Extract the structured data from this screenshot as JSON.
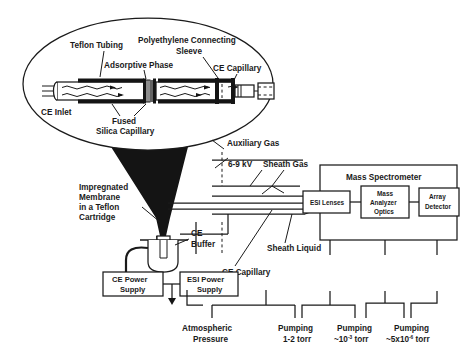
{
  "figure": {
    "inset": {
      "labels": {
        "teflon_tubing": "Teflon Tubing",
        "adsorptive_phase": "Adsorptive Phase",
        "polyethylene_sleeve_line1": "Polyethylene Connecting",
        "polyethylene_sleeve_line2": "Sleeve",
        "ce_capillary": "CE Capillary",
        "ce_inlet": "CE Inlet",
        "fused_line1": "Fused",
        "fused_line2": "Silica Capillary"
      }
    },
    "source_region": {
      "impregnated_line1": "Impregnated",
      "impregnated_line2": "Membrane",
      "impregnated_line3": "in a Teflon",
      "impregnated_line4": "Cartridge",
      "auxiliary_gas": "Auxiliary Gas",
      "voltage": "6-9 kV",
      "sheath_gas": "Sheath Gas",
      "sheath_liquid": "Sheath Liquid",
      "ce_buffer_line1": "CE",
      "ce_buffer_line2": "Buffer",
      "ce_capillary": "CE Capillary"
    },
    "power_supplies": {
      "ce_line1": "CE Power",
      "ce_line2": "Supply",
      "esi_line1": "ESI Power",
      "esi_line2": "Supply"
    },
    "mass_spectrometer": {
      "title": "Mass Spectrometer",
      "esi_lenses": "ESI Lenses",
      "analyzer_line1": "Mass",
      "analyzer_line2": "Analyzer",
      "analyzer_line3": "Optics",
      "detector_line1": "Array",
      "detector_line2": "Detector"
    },
    "pressure_stages": [
      {
        "name": "atmospheric",
        "line1": "Atmospheric",
        "line2": "Pressure"
      },
      {
        "name": "pump-1",
        "line1": "Pumping",
        "line2": "1-2 torr"
      },
      {
        "name": "pump-2",
        "line1": "Pumping",
        "line2_pre": "~10",
        "line2_exp": "-3",
        "line2_post": " torr"
      },
      {
        "name": "pump-3",
        "line1": "Pumping",
        "line2_pre": "~5x10",
        "line2_exp": "-6",
        "line2_post": " torr"
      }
    ],
    "colors": {
      "ink": "#1a1a1a",
      "cone_fill": "#141414",
      "background": "#ffffff"
    }
  }
}
